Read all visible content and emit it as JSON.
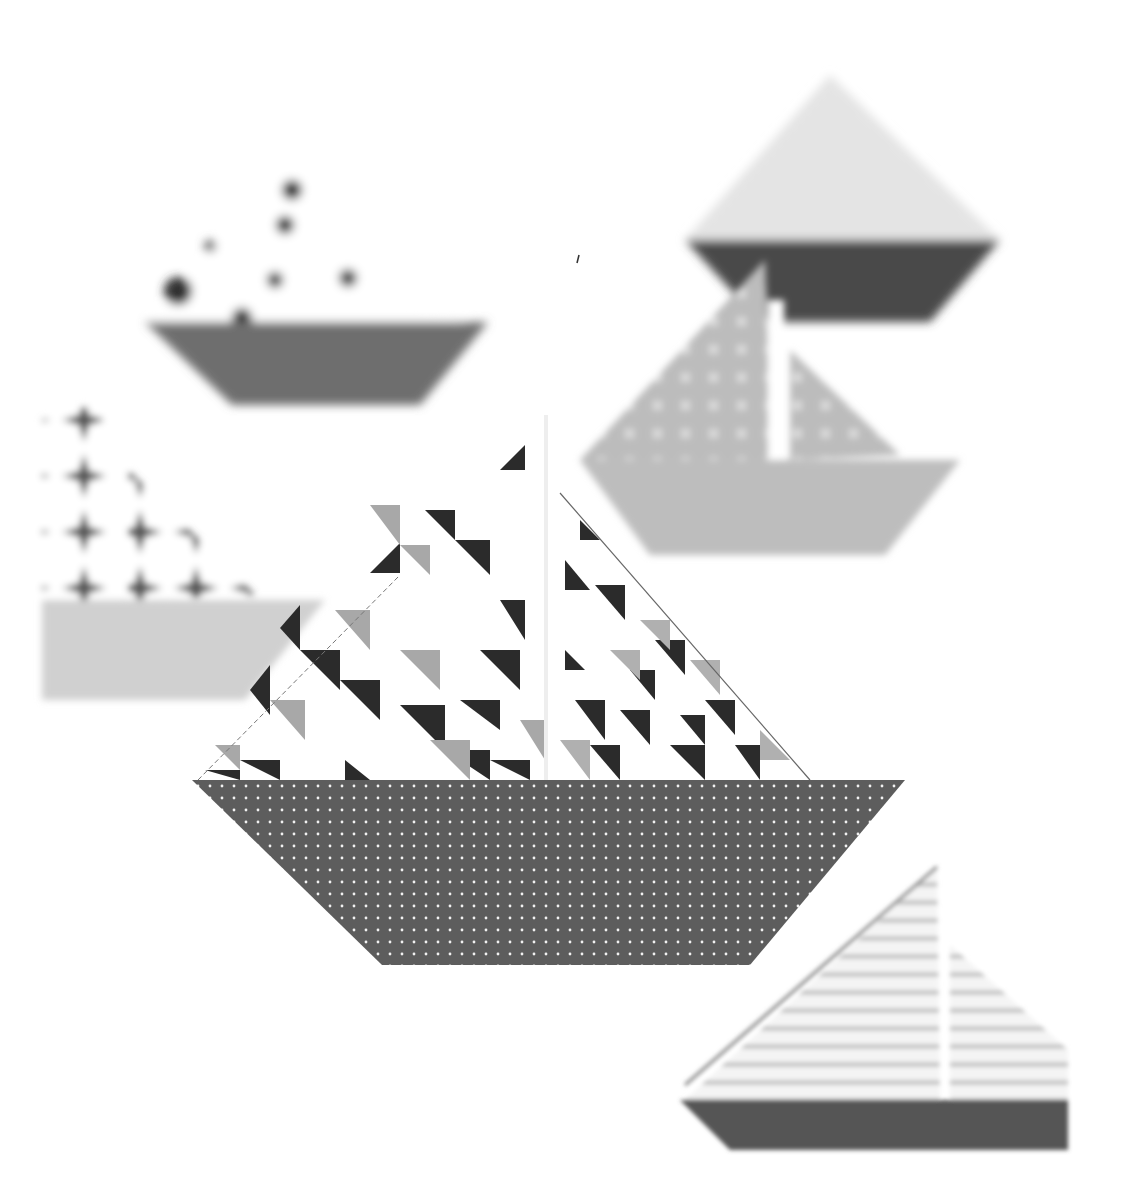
{
  "image": {
    "subject": "Origami paper sailboats",
    "style": "grayscale photograph",
    "background": "#ffffff",
    "boats": [
      {
        "id": "main",
        "position": "center",
        "focus": "sharp",
        "sail_pattern": "geometric triangles",
        "hull_pattern": "white polka dots on dark gray",
        "hull_color": "#5f5f5f"
      },
      {
        "id": "top-left",
        "position": "upper left",
        "focus": "blurred",
        "sail_pattern": "dark polka dots on white",
        "hull_color": "#6e6e6e"
      },
      {
        "id": "top-right",
        "position": "upper right",
        "focus": "blurred",
        "sail_pattern": "light pattern",
        "hull_color": "#4c4c4c"
      },
      {
        "id": "middle-right",
        "position": "right",
        "focus": "blurred",
        "sail_pattern": "light dotted gray",
        "hull_color": "#bdbdbd"
      },
      {
        "id": "left",
        "position": "left edge",
        "focus": "blurred",
        "sail_pattern": "star/asanoha pattern",
        "hull_color": "#cfcfcf"
      },
      {
        "id": "bottom-right",
        "position": "lower right",
        "focus": "blurred",
        "sail_pattern": "chevron lines",
        "hull_color": "#555555"
      }
    ]
  }
}
